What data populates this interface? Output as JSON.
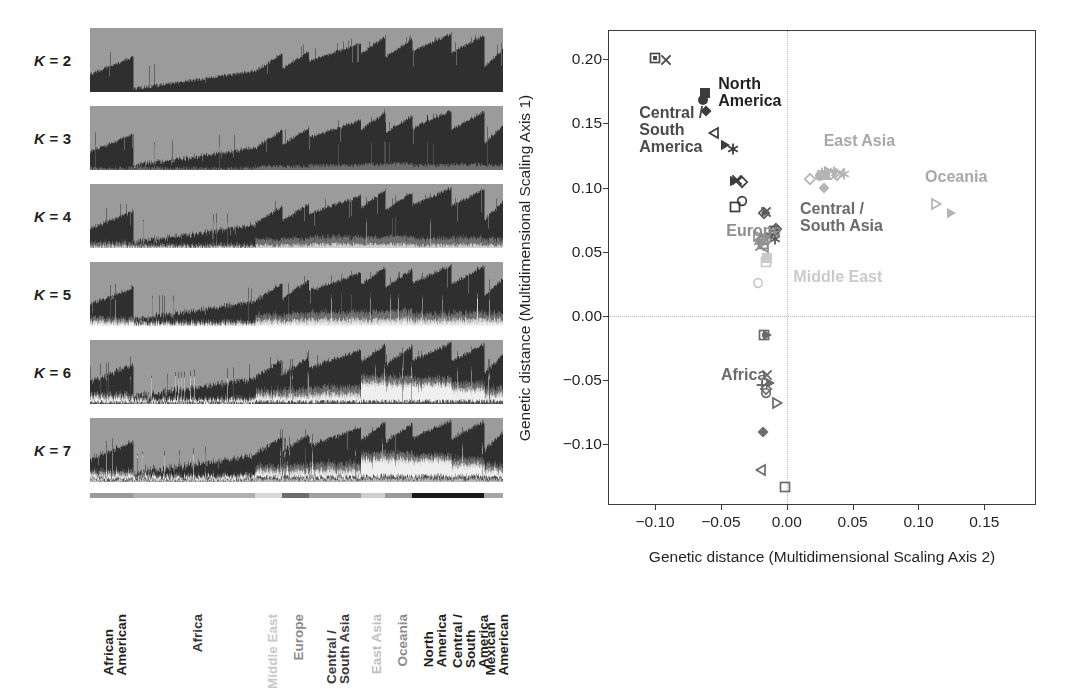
{
  "figure": {
    "panels": [
      "structure-admixture",
      "mds-scatter"
    ]
  },
  "structure": {
    "k_labels": [
      {
        "prefix": "K",
        "eq": " = ",
        "value": "2"
      },
      {
        "prefix": "K",
        "eq": " = ",
        "value": "3"
      },
      {
        "prefix": "K",
        "eq": " = ",
        "value": "4"
      },
      {
        "prefix": "K",
        "eq": " = ",
        "value": "5"
      },
      {
        "prefix": "K",
        "eq": " = ",
        "value": "6"
      },
      {
        "prefix": "K",
        "eq": " = ",
        "value": "7"
      }
    ],
    "k_values": [
      2,
      3,
      4,
      5,
      6,
      7
    ],
    "populations": [
      {
        "label_lines": [
          "African",
          "American"
        ],
        "color": "#231f20",
        "weight": "reg",
        "x_start": 0.0,
        "x_end": 0.105,
        "bar_color": "#9a9a9a"
      },
      {
        "label_lines": [
          "Africa"
        ],
        "color": "#3a3a3a",
        "weight": "bold",
        "x_start": 0.105,
        "x_end": 0.4,
        "bar_color": "#b0b0b0"
      },
      {
        "label_lines": [
          "Middle East"
        ],
        "color": "#c8c8c8",
        "weight": "bold",
        "x_start": 0.4,
        "x_end": 0.465,
        "bar_color": "#d8d8d8"
      },
      {
        "label_lines": [
          "Europe"
        ],
        "color": "#8c8c8c",
        "weight": "bold",
        "x_start": 0.465,
        "x_end": 0.53,
        "bar_color": "#6d6d6d"
      },
      {
        "label_lines": [
          "Central /",
          "South Asia"
        ],
        "color": "#3a3a3a",
        "weight": "bold",
        "x_start": 0.53,
        "x_end": 0.655,
        "bar_color": "#a0a0a0"
      },
      {
        "label_lines": [
          "East Asia"
        ],
        "color": "#c0c0c0",
        "weight": "bold",
        "x_start": 0.655,
        "x_end": 0.715,
        "bar_color": "#cfcfcf"
      },
      {
        "label_lines": [
          "Oceania"
        ],
        "color": "#8c8c8c",
        "weight": "bold",
        "x_start": 0.715,
        "x_end": 0.78,
        "bar_color": "#9a9a9a"
      },
      {
        "label_lines": [
          "North",
          "America"
        ],
        "color": "#231f20",
        "weight": "bold",
        "x_start": 0.78,
        "x_end": 0.875,
        "bar_color": "#1a1a1a"
      },
      {
        "label_lines": [
          "Central /",
          "South",
          "America"
        ],
        "color": "#231f20",
        "weight": "bold",
        "x_start": 0.875,
        "x_end": 0.955,
        "bar_color": "#1a1a1a"
      },
      {
        "label_lines": [
          "Mexican",
          "American"
        ],
        "color": "#231f20",
        "weight": "reg",
        "x_start": 0.955,
        "x_end": 1.0,
        "bar_color": "#a6a6a6"
      }
    ]
  },
  "chart_data": {
    "type": "scatter",
    "title": "",
    "xlabel": "Genetic distance (Multidimensional Scaling Axis 2)",
    "ylabel": "Genetic distance (Multidimensional Scaling Axis 1)",
    "xlim": [
      -0.135,
      0.19
    ],
    "ylim": [
      -0.148,
      0.222
    ],
    "xticks": [
      -0.1,
      -0.05,
      0.0,
      0.05,
      0.1,
      0.15
    ],
    "xticklabels": [
      "−0.10",
      "−0.05",
      "0.00",
      "0.05",
      "0.10",
      "0.15"
    ],
    "yticks": [
      0.2,
      0.15,
      0.1,
      0.05,
      0.0,
      -0.05,
      -0.1
    ],
    "yticklabels": [
      "0.20",
      "0.15",
      "0.10",
      "0.05",
      "0.00",
      "−0.05",
      "−0.10"
    ],
    "grid": "dotted reference lines at x=0.00 and y=0.00",
    "legend": "none (inline region annotations)",
    "annotations": [
      {
        "text_lines": [
          "Central /",
          "South",
          "America"
        ],
        "x": -0.112,
        "y": 0.158,
        "color": "#4a4a4a"
      },
      {
        "text_lines": [
          "North",
          "America"
        ],
        "x": -0.052,
        "y": 0.181,
        "color": "#231f20"
      },
      {
        "text_lines": [
          "East Asia"
        ],
        "x": 0.028,
        "y": 0.136,
        "color": "#a8a8a8"
      },
      {
        "text_lines": [
          "Oceania"
        ],
        "x": 0.105,
        "y": 0.108,
        "color": "#a8a8a8"
      },
      {
        "text_lines": [
          "Central /",
          "South Asia"
        ],
        "x": 0.01,
        "y": 0.083,
        "color": "#6b6b6b"
      },
      {
        "text_lines": [
          "Europe"
        ],
        "x": -0.046,
        "y": 0.066,
        "color": "#8e8e8e"
      },
      {
        "text_lines": [
          "Middle East"
        ],
        "x": 0.005,
        "y": 0.03,
        "color": "#cacaca"
      },
      {
        "text_lines": [
          "Africa"
        ],
        "x": -0.05,
        "y": -0.046,
        "color": "#6b6b6b"
      }
    ],
    "series": [
      {
        "name": "Central / South America",
        "color": "#4a4a4a",
        "points": [
          {
            "x": -0.1,
            "y": 0.201,
            "marker": "square-dot"
          },
          {
            "x": -0.092,
            "y": 0.1995,
            "marker": "x"
          }
        ]
      },
      {
        "name": "North America",
        "color": "#3c3c3c",
        "points": [
          {
            "x": -0.062,
            "y": 0.1735,
            "marker": "square-filled"
          },
          {
            "x": -0.064,
            "y": 0.168,
            "marker": "circle-filled"
          },
          {
            "x": -0.061,
            "y": 0.1595,
            "marker": "diamond-filled"
          },
          {
            "x": -0.055,
            "y": 0.1425,
            "marker": "triangle-left-open"
          },
          {
            "x": -0.047,
            "y": 0.133,
            "marker": "triangle-right-filled"
          },
          {
            "x": -0.041,
            "y": 0.13,
            "marker": "asterisk"
          },
          {
            "x": -0.04,
            "y": 0.1055,
            "marker": "triangle-right-filled"
          },
          {
            "x": -0.038,
            "y": 0.106,
            "marker": "x"
          },
          {
            "x": -0.034,
            "y": 0.1045,
            "marker": "diamond-open"
          },
          {
            "x": -0.034,
            "y": 0.0895,
            "marker": "circle-open"
          },
          {
            "x": -0.039,
            "y": 0.085,
            "marker": "square-open"
          }
        ]
      },
      {
        "name": "Central / South Asia",
        "color": "#5a5a5a",
        "points": [
          {
            "x": -0.017,
            "y": 0.0805,
            "marker": "diamond-dot"
          },
          {
            "x": -0.016,
            "y": 0.081,
            "marker": "x"
          },
          {
            "x": -0.008,
            "y": 0.0675,
            "marker": "diamond-dot"
          },
          {
            "x": -0.01,
            "y": 0.0665,
            "marker": "square-open"
          },
          {
            "x": -0.012,
            "y": 0.064,
            "marker": "plus"
          },
          {
            "x": -0.014,
            "y": 0.062,
            "marker": "triangle-right-filled"
          },
          {
            "x": -0.009,
            "y": 0.06,
            "marker": "asterisk"
          }
        ]
      },
      {
        "name": "Europe",
        "color": "#8e8e8e",
        "points": [
          {
            "x": -0.022,
            "y": 0.0625,
            "marker": "triangle-right-open"
          },
          {
            "x": -0.019,
            "y": 0.06,
            "marker": "diamond-open"
          },
          {
            "x": -0.021,
            "y": 0.0575,
            "marker": "asterisk"
          },
          {
            "x": -0.018,
            "y": 0.056,
            "marker": "square-open"
          },
          {
            "x": -0.017,
            "y": 0.0535,
            "marker": "triangle-left-open"
          },
          {
            "x": -0.02,
            "y": 0.0545,
            "marker": "x"
          },
          {
            "x": -0.016,
            "y": 0.059,
            "marker": "circle-open"
          },
          {
            "x": -0.0165,
            "y": 0.0615,
            "marker": "plus"
          }
        ]
      },
      {
        "name": "Middle East",
        "color": "#cacaca",
        "points": [
          {
            "x": -0.015,
            "y": 0.045,
            "marker": "square-filled"
          },
          {
            "x": -0.016,
            "y": 0.042,
            "marker": "square-open"
          },
          {
            "x": -0.022,
            "y": 0.0255,
            "marker": "circle-open"
          }
        ]
      },
      {
        "name": "East Asia",
        "color": "#b4b4b4",
        "points": [
          {
            "x": 0.0175,
            "y": 0.107,
            "marker": "diamond-open"
          },
          {
            "x": 0.025,
            "y": 0.109,
            "marker": "circle-filled"
          },
          {
            "x": 0.0265,
            "y": 0.1115,
            "marker": "asterisk"
          },
          {
            "x": 0.029,
            "y": 0.11,
            "marker": "square-filled"
          },
          {
            "x": 0.031,
            "y": 0.113,
            "marker": "triangle-right-filled"
          },
          {
            "x": 0.0335,
            "y": 0.1105,
            "marker": "diamond-open"
          },
          {
            "x": 0.0355,
            "y": 0.1125,
            "marker": "plus"
          },
          {
            "x": 0.038,
            "y": 0.1095,
            "marker": "diamond-open"
          },
          {
            "x": 0.0405,
            "y": 0.1115,
            "marker": "x"
          },
          {
            "x": 0.0435,
            "y": 0.1105,
            "marker": "asterisk"
          },
          {
            "x": 0.028,
            "y": 0.0995,
            "marker": "diamond-filled"
          }
        ]
      },
      {
        "name": "Oceania",
        "color": "#b4b4b4",
        "points": [
          {
            "x": 0.113,
            "y": 0.0875,
            "marker": "triangle-right-open"
          },
          {
            "x": 0.1245,
            "y": 0.08,
            "marker": "triangle-right-filled"
          }
        ]
      },
      {
        "name": "Africa",
        "color": "#6b6b6b",
        "points": [
          {
            "x": -0.0175,
            "y": -0.015,
            "marker": "square-dot"
          },
          {
            "x": -0.015,
            "y": -0.0145,
            "marker": "triangle-right-filled"
          },
          {
            "x": -0.015,
            "y": -0.046,
            "marker": "x"
          },
          {
            "x": -0.019,
            "y": -0.054,
            "marker": "plus"
          },
          {
            "x": -0.013,
            "y": -0.052,
            "marker": "triangle-right-filled"
          },
          {
            "x": -0.016,
            "y": -0.0565,
            "marker": "diamond-open"
          },
          {
            "x": -0.0155,
            "y": -0.06,
            "marker": "circle-open"
          },
          {
            "x": -0.0075,
            "y": -0.0675,
            "marker": "triangle-right-open"
          },
          {
            "x": -0.018,
            "y": -0.09,
            "marker": "diamond-filled"
          },
          {
            "x": -0.0195,
            "y": -0.12,
            "marker": "triangle-left-open"
          },
          {
            "x": -0.001,
            "y": -0.1335,
            "marker": "square-open"
          }
        ]
      }
    ]
  }
}
